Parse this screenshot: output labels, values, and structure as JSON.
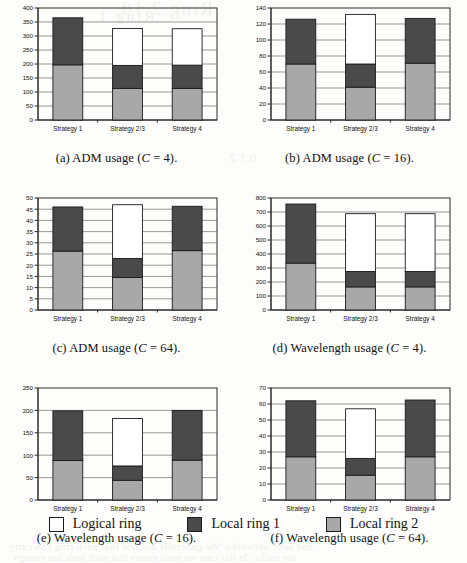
{
  "figure": {
    "legend": {
      "items": [
        {
          "label": "Logical ring",
          "color": "#ffffff",
          "key": "logical"
        },
        {
          "label": "Local ring 1",
          "color": "#4a4a4a",
          "key": "local1"
        },
        {
          "label": "Local ring 2",
          "color": "#a8a8a8",
          "key": "local2"
        }
      ]
    },
    "bleed_through": {
      "top_line1": "Ring 2   10",
      "top_line2": "Ring 1",
      "mid": "0 1 2",
      "bottom_line1": "and later networks. We generally assume that each ring can carry",
      "bottom_line2": "the traffic. In this case we must ensure that each node has enough"
    }
  },
  "colors": {
    "logical_ring": "#ffffff",
    "local_ring_1": "#4a4a4a",
    "local_ring_2": "#a8a8a8",
    "axis": "#2a2a2a",
    "gridline": "#555555",
    "background": "#fdfdfb"
  },
  "charts": [
    {
      "id": "a",
      "caption_prefix": "(a)",
      "caption_text": "ADM usage (",
      "caption_var": "C",
      "caption_eq": "= 4",
      "caption_suffix": ").",
      "chart_data": {
        "type": "bar",
        "stacked": true,
        "title": "(a) ADM usage (C = 4).",
        "xlabel": "",
        "ylabel": "",
        "ylim": [
          0,
          400
        ],
        "yticks": [
          0,
          50,
          100,
          150,
          200,
          250,
          300,
          350,
          400
        ],
        "grid": true,
        "legend_position": "figure-bottom",
        "categories": [
          "Strategy 1",
          "Strategy 2/3",
          "Strategy 4"
        ],
        "series": [
          {
            "name": "Local ring 2",
            "values": [
              197,
              113,
              113
            ]
          },
          {
            "name": "Local ring 1",
            "values": [
              168,
              82,
              83
            ]
          },
          {
            "name": "Logical ring",
            "values": [
              0,
              132,
              130
            ]
          }
        ],
        "totals": [
          365,
          327,
          326
        ]
      }
    },
    {
      "id": "b",
      "caption_prefix": "(b)",
      "caption_text": "ADM usage (",
      "caption_var": "C",
      "caption_eq": "= 16",
      "caption_suffix": ").",
      "chart_data": {
        "type": "bar",
        "stacked": true,
        "title": "(b) ADM usage (C = 16).",
        "xlabel": "",
        "ylabel": "",
        "ylim": [
          0,
          140
        ],
        "yticks": [
          0,
          20,
          40,
          60,
          80,
          100,
          120,
          140
        ],
        "grid": true,
        "legend_position": "figure-bottom",
        "categories": [
          "Strategy 1",
          "Strategy 2/3",
          "Strategy 4"
        ],
        "series": [
          {
            "name": "Local ring 2",
            "values": [
              70,
              41,
              71
            ]
          },
          {
            "name": "Local ring 1",
            "values": [
              56,
              29,
              56
            ]
          },
          {
            "name": "Logical ring",
            "values": [
              0,
              62,
              0
            ]
          }
        ],
        "totals": [
          126,
          132,
          127
        ]
      }
    },
    {
      "id": "c",
      "caption_prefix": "(c)",
      "caption_text": "ADM usage (",
      "caption_var": "C",
      "caption_eq": "= 64",
      "caption_suffix": ").",
      "chart_data": {
        "type": "bar",
        "stacked": true,
        "title": "(c) ADM usage (C = 64).",
        "xlabel": "",
        "ylabel": "",
        "ylim": [
          0,
          50
        ],
        "yticks": [
          0,
          5,
          10,
          15,
          20,
          25,
          30,
          35,
          40,
          45,
          50
        ],
        "grid": true,
        "legend_position": "figure-bottom",
        "categories": [
          "Strategy 1",
          "Strategy 2/3",
          "Strategy 4"
        ],
        "series": [
          {
            "name": "Local ring 2",
            "values": [
              26.3,
              14.5,
              26.5
            ]
          },
          {
            "name": "Local ring 1",
            "values": [
              19.7,
              8.5,
              19.8
            ]
          },
          {
            "name": "Logical ring",
            "values": [
              0,
              24,
              0
            ]
          }
        ],
        "totals": [
          46,
          47,
          46.3
        ]
      }
    },
    {
      "id": "d",
      "caption_prefix": "(d)",
      "caption_text": "Wavelength usage (",
      "caption_var": "C",
      "caption_eq": "= 4",
      "caption_suffix": ").",
      "chart_data": {
        "type": "bar",
        "stacked": true,
        "title": "(d) Wavelength usage (C = 4).",
        "xlabel": "",
        "ylabel": "",
        "ylim": [
          0,
          800
        ],
        "yticks": [
          0,
          100,
          200,
          300,
          400,
          500,
          600,
          700,
          800
        ],
        "grid": true,
        "legend_position": "figure-bottom",
        "categories": [
          "Strategy 1",
          "Strategy 2/3",
          "Strategy 4"
        ],
        "series": [
          {
            "name": "Local ring 2",
            "values": [
              335,
              165,
              165
            ]
          },
          {
            "name": "Local ring 1",
            "values": [
              422,
              110,
              110
            ]
          },
          {
            "name": "Logical ring",
            "values": [
              0,
              413,
              413
            ]
          }
        ],
        "totals": [
          757,
          688,
          688
        ]
      }
    },
    {
      "id": "e",
      "caption_prefix": "(e)",
      "caption_text": "Wavelength usage (",
      "caption_var": "C",
      "caption_eq": "= 16",
      "caption_suffix": ").",
      "chart_data": {
        "type": "bar",
        "stacked": true,
        "title": "(e) Wavelength usage (C = 16).",
        "xlabel": "",
        "ylabel": "",
        "ylim": [
          0,
          250
        ],
        "yticks": [
          0,
          50,
          100,
          150,
          200,
          250
        ],
        "grid": true,
        "legend_position": "figure-bottom",
        "categories": [
          "Strategy 1",
          "Strategy 2/3",
          "Strategy 4"
        ],
        "series": [
          {
            "name": "Local ring 2",
            "values": [
              88,
              44,
              89
            ]
          },
          {
            "name": "Local ring 1",
            "values": [
              111,
              32,
              111
            ]
          },
          {
            "name": "Logical ring",
            "values": [
              0,
              106,
              0
            ]
          }
        ],
        "totals": [
          199,
          182,
          200
        ]
      }
    },
    {
      "id": "f",
      "caption_prefix": "(f)",
      "caption_text": "Wavelength usage (",
      "caption_var": "C",
      "caption_eq": "= 64",
      "caption_suffix": ").",
      "chart_data": {
        "type": "bar",
        "stacked": true,
        "title": "(f) Wavelength usage (C = 64).",
        "xlabel": "",
        "ylabel": "",
        "ylim": [
          0,
          70
        ],
        "yticks": [
          0,
          10,
          20,
          30,
          40,
          50,
          60,
          70
        ],
        "grid": true,
        "legend_position": "figure-bottom",
        "categories": [
          "Strategy 1",
          "Strategy 2/3",
          "Strategy 4"
        ],
        "series": [
          {
            "name": "Local ring 2",
            "values": [
              27,
              15.5,
              27
            ]
          },
          {
            "name": "Local ring 1",
            "values": [
              35,
              10.5,
              35.5
            ]
          },
          {
            "name": "Logical ring",
            "values": [
              0,
              31,
              0
            ]
          }
        ],
        "totals": [
          62,
          57,
          62.5
        ]
      }
    }
  ]
}
